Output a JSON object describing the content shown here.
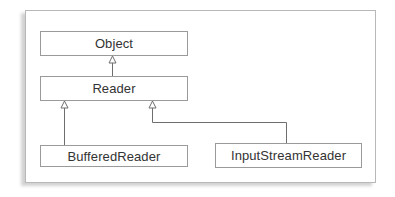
{
  "diagram": {
    "type": "uml-class-hierarchy",
    "classes": [
      {
        "id": "object",
        "label": "Object"
      },
      {
        "id": "reader",
        "label": "Reader"
      },
      {
        "id": "buffered",
        "label": "BufferedReader"
      },
      {
        "id": "isr",
        "label": "InputStreamReader"
      }
    ],
    "relations": [
      {
        "from": "Reader",
        "to": "Object",
        "kind": "inherits"
      },
      {
        "from": "BufferedReader",
        "to": "Reader",
        "kind": "inherits"
      },
      {
        "from": "InputStreamReader",
        "to": "Reader",
        "kind": "inherits"
      }
    ],
    "colors": {
      "line": "#6e6e6e",
      "box_border": "#9a9a9a",
      "text": "#333333"
    }
  }
}
